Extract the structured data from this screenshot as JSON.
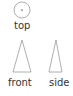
{
  "views": [
    {
      "id": "top",
      "label": "top",
      "shape": "circle-with-center-dot"
    },
    {
      "id": "front",
      "label": "front",
      "shape": "tall-triangle"
    },
    {
      "id": "side",
      "label": "side",
      "shape": "narrow-tall-triangle"
    }
  ],
  "colors": {
    "stroke": "#9a9a9a",
    "dot": "#999999",
    "text": "#333333"
  }
}
